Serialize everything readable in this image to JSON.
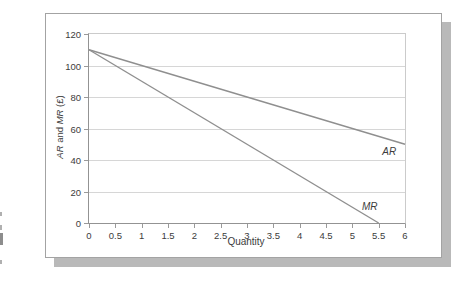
{
  "chart_data": {
    "type": "line",
    "title": "",
    "xlabel": "Quantity",
    "ylabel": "AR and MR (£)",
    "ylabel_parts": [
      {
        "text": "AR",
        "italic": true
      },
      {
        "text": " and ",
        "italic": false
      },
      {
        "text": "MR",
        "italic": true
      },
      {
        "text": " (£)",
        "italic": false
      }
    ],
    "xlim": [
      0,
      6
    ],
    "ylim": [
      0,
      120
    ],
    "x_ticks": [
      "0",
      "0.5",
      "1",
      "1.5",
      "2",
      "2.5",
      "3",
      "3.5",
      "4",
      "4.5",
      "5",
      "5.5",
      "6"
    ],
    "y_ticks": [
      "0",
      "20",
      "40",
      "60",
      "80",
      "100",
      "120"
    ],
    "grid": "horizontal",
    "legend_position": "inline-labels",
    "series": [
      {
        "name": "AR",
        "label": "AR",
        "x": [
          0,
          6
        ],
        "y": [
          110,
          50
        ],
        "label_pos": [
          5.7,
          46
        ]
      },
      {
        "name": "MR",
        "label": "MR",
        "x": [
          0,
          5.5
        ],
        "y": [
          110,
          0
        ],
        "label_pos": [
          5.33,
          11
        ]
      }
    ]
  },
  "colors": {
    "line": "#8f8f8f",
    "gridline": "#d6d6d6",
    "axis": "#939393",
    "text": "#3c3c3c",
    "figure_border": "#a3a3a3",
    "figure_shadow": "#b9b9b9"
  }
}
